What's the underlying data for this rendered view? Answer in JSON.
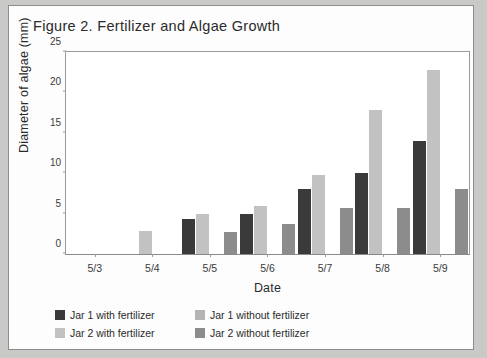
{
  "chart_data": {
    "type": "bar",
    "title": "Figure 2. Fertilizer and Algae Growth",
    "xlabel": "Date",
    "ylabel": "Diameter of algae (mm)",
    "categories": [
      "5/3",
      "5/4",
      "5/5",
      "5/6",
      "5/7",
      "5/8",
      "5/9"
    ],
    "ylim": [
      0,
      25
    ],
    "yticks": [
      0,
      5,
      10,
      15,
      20,
      25
    ],
    "ytick_labels": [
      "0",
      "5",
      "10",
      "15",
      "20",
      "25"
    ],
    "grid": false,
    "legend_position": "below",
    "series": [
      {
        "name": "Jar 1 with fertilizer",
        "color": "#3a3a3a",
        "values": [
          0,
          0,
          4.3,
          5.0,
          8.0,
          10.0,
          14.0
        ]
      },
      {
        "name": "Jar 2 with fertilizer",
        "color": "#c2c2c2",
        "values": [
          0,
          2.9,
          5.0,
          6.0,
          9.8,
          17.8,
          22.8
        ]
      },
      {
        "name": "Jar 1 without fertilizer",
        "color": "#b4b4b4",
        "values": [
          0,
          0,
          0,
          0,
          0,
          0,
          0
        ]
      },
      {
        "name": "Jar 2 without fertilizer",
        "color": "#8c8c8c",
        "values": [
          0,
          0,
          2.7,
          3.7,
          5.7,
          5.7,
          8.0
        ]
      }
    ]
  },
  "legend": {
    "entries": [
      {
        "label": "Jar 1 with fertilizer",
        "color": "#3a3a3a"
      },
      {
        "label": "Jar 1 without fertilizer",
        "color": "#b4b4b4"
      },
      {
        "label": "Jar 2 with fertilizer",
        "color": "#c2c2c2"
      },
      {
        "label": "Jar 2 without fertilizer",
        "color": "#8c8c8c"
      }
    ]
  },
  "colors": {
    "page_background": "#c9c9c7",
    "card_background": "#fdfdfd",
    "axis": "#9a9a9a",
    "text": "#2b2b2b"
  }
}
